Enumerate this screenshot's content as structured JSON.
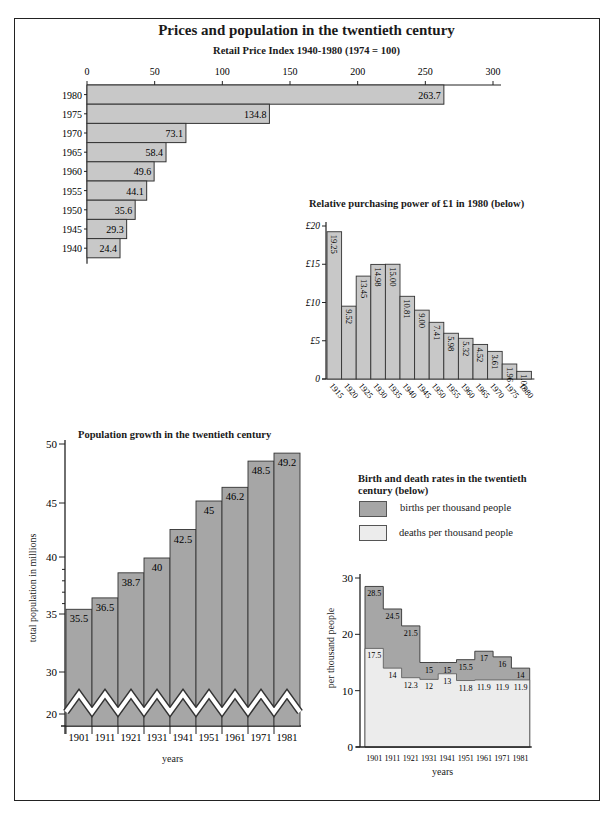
{
  "page": {
    "title": "Prices and population in the twentieth century"
  },
  "chart_data": [
    {
      "id": "retail_price_index",
      "type": "bar",
      "orientation": "horizontal",
      "title": "Retail Price Index 1940-1980 (1974 = 100)",
      "categories": [
        "1980",
        "1975",
        "1970",
        "1965",
        "1960",
        "1955",
        "1950",
        "1945",
        "1940"
      ],
      "values": [
        263.7,
        134.8,
        73.1,
        58.4,
        49.6,
        44.1,
        35.6,
        29.3,
        24.4
      ],
      "labels": [
        "263.7",
        "134.8",
        "73.1",
        "58.4",
        "49.6",
        "44.1",
        "35.6",
        "29.3",
        "24.4"
      ],
      "xticks": [
        "0",
        "50",
        "100",
        "150",
        "200",
        "250",
        "300"
      ],
      "xlim": [
        0,
        300
      ],
      "xlabel": "",
      "ylabel": "",
      "bar_color": "#c8c8c8"
    },
    {
      "id": "purchasing_power",
      "type": "bar",
      "title": "Relative purchasing power of £1 in 1980 (below)",
      "categories": [
        "1915",
        "1920",
        "1925",
        "1930",
        "1935",
        "1940",
        "1945",
        "1950",
        "1955",
        "1960",
        "1965",
        "1970",
        "1975",
        "1980"
      ],
      "values": [
        19.25,
        9.52,
        13.45,
        14.98,
        15.0,
        10.81,
        9.0,
        7.41,
        5.98,
        5.32,
        4.52,
        3.61,
        1.96,
        1.0
      ],
      "labels": [
        "19.25",
        "9.52",
        "13.45",
        "14.98",
        "15.00",
        "10.81",
        "9.00",
        "7.41",
        "5.98",
        "5.32",
        "4.52",
        "3.61",
        "1.96",
        "1.00"
      ],
      "yticks": [
        "0",
        "£5",
        "£10",
        "£15",
        "£20"
      ],
      "ylim": [
        0,
        20
      ],
      "bar_color": "#c8c8c8"
    },
    {
      "id": "population_growth",
      "type": "bar",
      "title": "Population growth in the twentieth century",
      "categories": [
        "1901",
        "1911",
        "1921",
        "1931",
        "1941",
        "1951",
        "1961",
        "1971",
        "1981"
      ],
      "values": [
        35.5,
        36.5,
        38.7,
        40,
        42.5,
        45,
        46.2,
        48.5,
        49.2
      ],
      "labels": [
        "35.5",
        "36.5",
        "38.7",
        "40",
        "42.5",
        "45",
        "46.2",
        "48.5",
        "49.2"
      ],
      "yticks": [
        "20",
        "30",
        "35",
        "40",
        "45",
        "50"
      ],
      "ylim": [
        20,
        50
      ],
      "axis_break": "between 20 and 30",
      "xlabel": "years",
      "ylabel": "total population in millions",
      "bar_color": "#a6a6a6"
    },
    {
      "id": "birth_death_rates",
      "type": "area",
      "title": "Birth and death rates in the twentieth century (below)",
      "categories": [
        "1901",
        "1911",
        "1921",
        "1931",
        "1941",
        "1951",
        "1961",
        "1971",
        "1981"
      ],
      "series": [
        {
          "name": "births per thousand people",
          "values": [
            28.5,
            24.5,
            21.5,
            15,
            15,
            15.5,
            17,
            16,
            14
          ],
          "labels": [
            "28.5",
            "24.5",
            "21.5",
            "15",
            "15",
            "15.5",
            "17",
            "16",
            "14"
          ],
          "color": "#a6a6a6"
        },
        {
          "name": "deaths per thousand people",
          "values": [
            17.5,
            14,
            12.3,
            12,
            13,
            11.8,
            11.9,
            11.9,
            11.9
          ],
          "labels": [
            "17.5",
            "14",
            "12.3",
            "12",
            "13",
            "11.8",
            "11.9",
            "11.9",
            "11.9"
          ],
          "color": "#ececec"
        }
      ],
      "yticks": [
        "0",
        "10",
        "20",
        "30"
      ],
      "ylim": [
        0,
        30
      ],
      "xlabel": "years",
      "ylabel": "per thousand people"
    }
  ],
  "legend": {
    "births": "births per thousand people",
    "deaths": "deaths per thousand people"
  }
}
